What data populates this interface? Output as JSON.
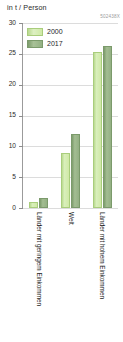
{
  "chart_data": {
    "type": "bar",
    "title": "",
    "ylabel": "in t / Person",
    "xlabel": "",
    "ylim": [
      0,
      30
    ],
    "ytick_step": 5,
    "yticks": [
      30,
      25,
      20,
      15,
      10,
      5,
      0
    ],
    "grid": true,
    "legend_position": "top-left",
    "categories": [
      "Länder mit geringem Einkommen",
      "Welt",
      "Länder mit hohem Einkommen"
    ],
    "series": [
      {
        "name": "2000",
        "color": "#cfe9a6",
        "values": [
          1.0,
          8.9,
          25.3
        ]
      },
      {
        "name": "2017",
        "color": "#93b083",
        "values": [
          1.7,
          12.0,
          26.2
        ]
      }
    ]
  },
  "header": {
    "unit_label": "in t / Person",
    "source_code": "502438X"
  },
  "axis": {
    "tick_labels": [
      "30",
      "25",
      "20",
      "15",
      "10",
      "5",
      "0"
    ]
  },
  "legend": {
    "items": [
      {
        "label": "2000"
      },
      {
        "label": "2017"
      }
    ]
  }
}
